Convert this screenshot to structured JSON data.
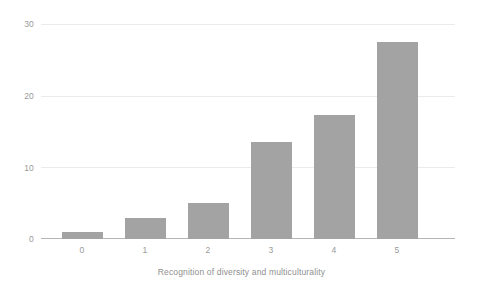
{
  "chart_data": {
    "type": "bar",
    "title": "",
    "subtitle": "",
    "xlabel": "Recognition of diversity and multiculturality",
    "ylabel": "",
    "categories": [
      "0",
      "1",
      "2",
      "3",
      "4",
      "5"
    ],
    "values": [
      1,
      3,
      5,
      13.5,
      17.3,
      27.5
    ],
    "series": [
      {
        "name": "Count",
        "values": [
          1,
          3,
          5,
          13.5,
          17.3,
          27.5
        ]
      }
    ],
    "ylim": [
      0,
      30
    ],
    "y_ticks": [
      "0",
      "10",
      "20",
      "30"
    ],
    "y_tick_values": [
      0,
      10,
      20,
      30
    ],
    "x_ticks": [
      "0",
      "1",
      "2",
      "3",
      "4",
      "5"
    ],
    "grid": true,
    "grid_axis": "y",
    "legend": false,
    "legend_position": "none",
    "bar_color": "#a3a3a3",
    "grid_color": "#ebebeb",
    "axis_color": "#b5b5b5",
    "tick_label_color": "#9a9a9a",
    "axis_title_color": "#8f8f8f",
    "background_color": "#ffffff",
    "annotations": []
  }
}
